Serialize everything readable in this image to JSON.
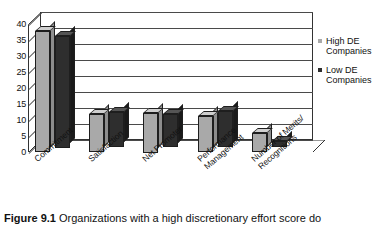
{
  "chart_data": {
    "type": "bar",
    "title": "",
    "xlabel": "",
    "ylabel": "",
    "ylim": [
      0,
      40
    ],
    "ytick_step": 5,
    "yticks": [
      "40",
      "35",
      "30",
      "25",
      "20",
      "15",
      "10",
      "5",
      "0"
    ],
    "grid": true,
    "legend_position": "right",
    "three_d": true,
    "categories": [
      "Commitment",
      "Satisfaction",
      "Net Promoter",
      "Performance\nManagement",
      "Number of Merits/\nRecognitions"
    ],
    "series": [
      {
        "name": "High DE Companies",
        "color": "#a9a9a9",
        "values": [
          38,
          12,
          12.5,
          11.5,
          6
        ]
      },
      {
        "name": "Low DE Companies",
        "color": "#2e2e2e",
        "values": [
          35,
          11,
          10.5,
          11.5,
          2
        ]
      }
    ]
  },
  "legend": {
    "items": [
      {
        "label": "High DE\nCompanies",
        "label_line1": "High DE",
        "label_line2": "Companies",
        "color": "#a9a9a9"
      },
      {
        "label": "Low DE\nCompanies",
        "label_line1": "Low DE",
        "label_line2": "Companies",
        "color": "#2e2e2e"
      }
    ]
  },
  "caption": {
    "figure_number": "Figure 9.1",
    "text": "Organizations with a high discretionary effort score do"
  },
  "colors": {
    "high_de": "#a9a9a9",
    "low_de": "#2e2e2e",
    "axis": "#333333",
    "gridline": "#4a4a4a",
    "background": "#ffffff"
  }
}
